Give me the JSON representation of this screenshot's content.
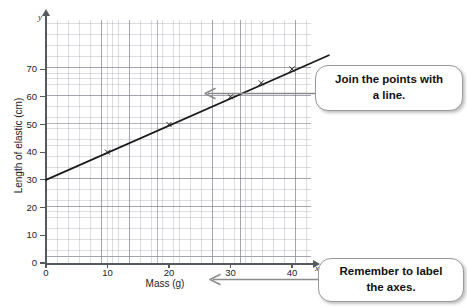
{
  "chart_data": {
    "type": "line",
    "title": "",
    "xlabel": "Mass (g)",
    "ylabel": "Length of elastic (cm)",
    "x_var": "x",
    "y_var": "y",
    "xlim": [
      0,
      43
    ],
    "ylim": [
      0,
      78
    ],
    "xticks": [
      0,
      10,
      20,
      30,
      40
    ],
    "yticks": [
      0,
      10,
      20,
      30,
      40,
      50,
      60,
      70
    ],
    "xtick_labels": [
      "0",
      "10",
      "20",
      "30",
      "40"
    ],
    "ytick_labels": [
      "0",
      "10",
      "20",
      "30",
      "40",
      "50",
      "60",
      "70"
    ],
    "grid": true,
    "grid_minor": true,
    "legend": "none",
    "series": [
      {
        "name": "Length of elastic vs mass",
        "marker": "cross",
        "line_style": "solid",
        "line_color": "#1a1a1a",
        "x": [
          10,
          20,
          30,
          35,
          40
        ],
        "y": [
          40,
          50,
          60,
          65,
          70
        ]
      }
    ],
    "fit_line": {
      "description": "straight line through the plotted points",
      "x_start": 0,
      "y_start": 30,
      "x_end": 46,
      "y_end": 75
    }
  },
  "axes": {
    "y_axis_title": "Length of elastic (cm)",
    "x_axis_title": "Mass (g)",
    "y_axis_variable": "y",
    "x_axis_variable": "x"
  },
  "callouts": [
    {
      "id": "join-points",
      "line1": "Join the points with",
      "line2": "a line.",
      "text": "Join the points with a line.",
      "arrow": "points-left-into-chart"
    },
    {
      "id": "label-axes",
      "line1": "Remember to label",
      "line2": "the axes.",
      "text": "Remember to label the axes.",
      "arrow": "points-left-to-x-axis-title"
    }
  ],
  "colors": {
    "axis": "#555a60",
    "grid_major": "#787887",
    "grid_minor": "#9696a5",
    "data_line": "#1a1a1a",
    "callout_border": "#9a9a9a",
    "callout_arrow": "#8c8c8c",
    "background": "#ffffff"
  }
}
